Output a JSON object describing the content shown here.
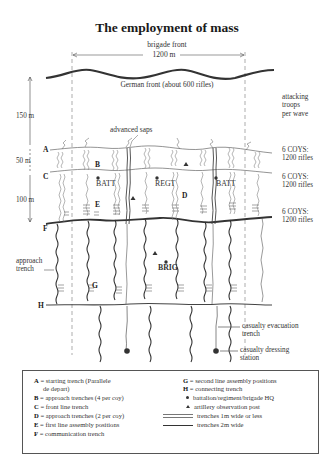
{
  "title": "The employment of mass",
  "top": {
    "brigade_front_label": "brigade front",
    "brigade_front_width": "1200 m",
    "german_front": "German front (about 600 rifles)",
    "advanced_saps": "advanced saps"
  },
  "distances": {
    "d150": "150 m",
    "d50": "50 m",
    "d100": "100 m"
  },
  "right_labels": {
    "attacking_troops": [
      "attacking",
      "troops",
      "per wave"
    ],
    "wave1": [
      "6 COYS:",
      "1200 rifles"
    ],
    "wave2": [
      "6 COYS:",
      "1200 rifles"
    ],
    "wave3": [
      "6 COYS:",
      "1200 rifles"
    ],
    "casualty_evac": [
      "casualty evacuation",
      "trench"
    ],
    "casualty_station": [
      "casualty dressing",
      "station"
    ]
  },
  "letters": {
    "A": "A",
    "B": "B",
    "C": "C",
    "D": "D",
    "E": "E",
    "F": "F",
    "G": "G",
    "H": "H"
  },
  "hq_labels": {
    "batt_left": "BATT",
    "regt": "REGT",
    "batt_right": "BATT",
    "brig": "BRIG"
  },
  "approach_trench": [
    "approach",
    "trench"
  ],
  "legend": {
    "left": [
      {
        "key": "A",
        "text": "= starting trench (Parallele",
        "cont": "de depart)"
      },
      {
        "key": "B",
        "text": "= approach trenches (4 per coy)"
      },
      {
        "key": "C",
        "text": "= front line trench"
      },
      {
        "key": "D",
        "text": "= approach trenches (2 per coy)"
      },
      {
        "key": "E",
        "text": "= first line assembly positions"
      },
      {
        "key": "F",
        "text": "= communication trench"
      }
    ],
    "right": [
      {
        "key": "G",
        "text": "= second line assembly positions"
      },
      {
        "key": "H",
        "text": "= connecting trench"
      },
      {
        "symbol": "dot-icon",
        "text": "battalion/regiment/brigade HQ"
      },
      {
        "symbol": "triangle-icon",
        "text": "artillery observation post"
      },
      {
        "symbol": "thin-double-line",
        "text": "trenches 1m wide or less"
      },
      {
        "symbol": "thick-line",
        "text": "trenches 2m wide"
      }
    ]
  },
  "colors": {
    "line": "#3a3a3a",
    "thin_line": "#666666",
    "background": "#ffffff"
  }
}
